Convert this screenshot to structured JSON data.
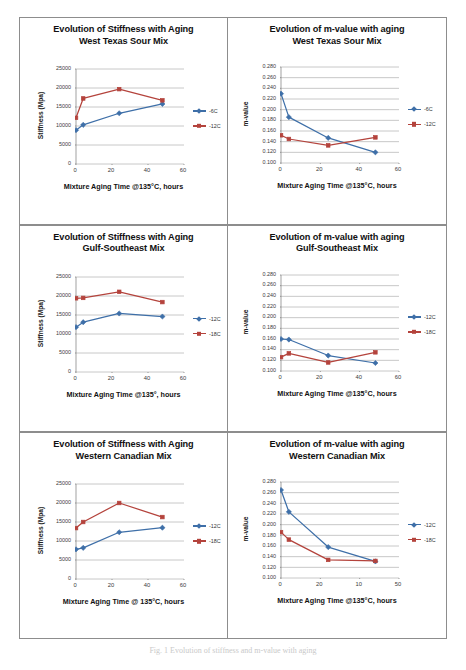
{
  "figure": {
    "caption": "Fig. 1 Evolution of stiffness and m-value with aging"
  },
  "colors": {
    "series_blue": "#3E6FA8",
    "series_red": "#B4433C",
    "grid": "#9a9a9a",
    "axis": "#7a7a7a",
    "panel_border": "#8d8d8d",
    "text": "#111111"
  },
  "panels": [
    {
      "id": "stiffness-west-texas",
      "title_line1": "Evolution of Stiffness with Aging",
      "title_line2": "West Texas Sour Mix",
      "chart_data": {
        "type": "line",
        "title": "Evolution of Stiffness with Aging West Texas Sour Mix",
        "xlabel": "Mixture Aging Time @135°C, hours",
        "ylabel": "Stiffness  (Mpa)",
        "xlim": [
          0,
          60
        ],
        "ylim": [
          0,
          25000
        ],
        "xticks": [
          0,
          20,
          40,
          60
        ],
        "yticks": [
          0,
          5000,
          10000,
          15000,
          20000,
          25000
        ],
        "grid": true,
        "legend_position": "right",
        "series": [
          {
            "name": "-6C",
            "color": "#3E6FA8",
            "marker": "diamond",
            "x": [
              0,
              4,
              24,
              48
            ],
            "y": [
              8900,
              10300,
              13350,
              15800
            ]
          },
          {
            "name": "-12C",
            "color": "#B4433C",
            "marker": "square",
            "x": [
              0,
              4,
              24,
              48
            ],
            "y": [
              12150,
              17250,
              19700,
              16750
            ]
          }
        ]
      }
    },
    {
      "id": "mvalue-west-texas",
      "title_line1": "Evolution of m-value with aging",
      "title_line2": "West Texas Sour Mix",
      "chart_data": {
        "type": "line",
        "title": "Evolution of m-value with aging West Texas Sour Mix",
        "xlabel": "Mixture Aging Time @135°C, hours",
        "ylabel": "m-value",
        "xlim": [
          0,
          60
        ],
        "ylim": [
          0.1,
          0.28
        ],
        "xticks": [
          0,
          20,
          40,
          60
        ],
        "yticks": [
          0.1,
          0.12,
          0.14,
          0.16,
          0.18,
          0.2,
          0.22,
          0.24,
          0.26,
          0.28
        ],
        "ytick_labels": [
          "0.100",
          "0.120",
          "0.140",
          "0.160",
          "0.180",
          "0.200",
          "0.220",
          "0.240",
          "0.260",
          "0.280"
        ],
        "grid": true,
        "legend_position": "right",
        "series": [
          {
            "name": "-6C",
            "color": "#3E6FA8",
            "marker": "diamond",
            "x": [
              0,
              4,
              24,
              48
            ],
            "y": [
              0.23,
              0.186,
              0.147,
              0.12
            ]
          },
          {
            "name": "-12C",
            "color": "#B4433C",
            "marker": "square",
            "x": [
              0,
              4,
              24,
              48
            ],
            "y": [
              0.152,
              0.145,
              0.133,
              0.148
            ]
          }
        ]
      }
    },
    {
      "id": "stiffness-gulf-southeast",
      "title_line1": "Evolution of Stiffness with Aging",
      "title_line2": "Gulf-Southeast Mix",
      "chart_data": {
        "type": "line",
        "title": "Evolution of Stiffness with Aging Gulf-Southeast Mix",
        "xlabel": "Mixture Aging Time @135°, hours",
        "ylabel": "Stiffness (Mpa)",
        "xlim": [
          0,
          60
        ],
        "ylim": [
          0,
          25000
        ],
        "xticks": [
          0,
          20,
          40,
          60
        ],
        "yticks": [
          0,
          5000,
          10000,
          15000,
          20000,
          25000
        ],
        "grid": true,
        "legend_position": "right",
        "series": [
          {
            "name": "-12C",
            "color": "#3E6FA8",
            "marker": "diamond",
            "x": [
              0,
              4,
              24,
              48
            ],
            "y": [
              11800,
              13100,
              15400,
              14600
            ]
          },
          {
            "name": "-18C",
            "color": "#B4433C",
            "marker": "square",
            "x": [
              0,
              4,
              24,
              48
            ],
            "y": [
              19400,
              19500,
              21100,
              18400
            ]
          }
        ]
      }
    },
    {
      "id": "mvalue-gulf-southeast",
      "title_line1": "Evolution of m-value with aging",
      "title_line2": "Gulf-Southeast Mix",
      "chart_data": {
        "type": "line",
        "title": "Evolution of m-value with aging Gulf-Southeast Mix",
        "xlabel": "Mixture Aging Time @135°C, hours",
        "ylabel": "m-value",
        "xlim": [
          0,
          60
        ],
        "ylim": [
          0.1,
          0.28
        ],
        "xticks": [
          0,
          20,
          40,
          60
        ],
        "yticks": [
          0.1,
          0.12,
          0.14,
          0.16,
          0.18,
          0.2,
          0.22,
          0.24,
          0.26,
          0.28
        ],
        "ytick_labels": [
          "0.100",
          "0.120",
          "0.140",
          "0.160",
          "0.180",
          "0.200",
          "0.220",
          "0.240",
          "0.260",
          "0.280"
        ],
        "grid": true,
        "legend_position": "right",
        "series": [
          {
            "name": "-12C",
            "color": "#3E6FA8",
            "marker": "diamond",
            "x": [
              0,
              4,
              24,
              48
            ],
            "y": [
              0.16,
              0.159,
              0.129,
              0.115
            ]
          },
          {
            "name": "-18C",
            "color": "#B4433C",
            "marker": "square",
            "x": [
              0,
              4,
              24,
              48
            ],
            "y": [
              0.126,
              0.133,
              0.116,
              0.135
            ]
          }
        ]
      }
    },
    {
      "id": "stiffness-western-canadian",
      "title_line1": "Evolution of Stiffness with Aging",
      "title_line2": "Western Canadian  Mix",
      "chart_data": {
        "type": "line",
        "title": "Evolution of Stiffness with Aging Western Canadian Mix",
        "xlabel": "Mixture Aging Time @ 135°C, hours",
        "ylabel": "Stiffness (Mpa)",
        "xlim": [
          0,
          60
        ],
        "ylim": [
          0,
          25000
        ],
        "xticks": [
          0,
          20,
          40,
          60
        ],
        "yticks": [
          0,
          5000,
          10000,
          15000,
          20000,
          25000
        ],
        "grid": true,
        "legend_position": "right",
        "series": [
          {
            "name": "-12C",
            "color": "#3E6FA8",
            "marker": "diamond",
            "x": [
              0,
              4,
              24,
              48
            ],
            "y": [
              7800,
              8200,
              12300,
              13500
            ]
          },
          {
            "name": "-18C",
            "color": "#B4433C",
            "marker": "square",
            "x": [
              0,
              4,
              24,
              48
            ],
            "y": [
              13400,
              15000,
              20000,
              16300
            ]
          }
        ]
      }
    },
    {
      "id": "mvalue-western-canadian",
      "title_line1": "Evolution of m-value with aging",
      "title_line2": "Western Canadian Mix",
      "chart_data": {
        "type": "line",
        "title": "Evolution of m-value with aging Western Canadian Mix",
        "xlabel": "Mixture Aging Time @135°C, hours",
        "ylabel": "m-value",
        "xlim": [
          0,
          60
        ],
        "ylim": [
          0.1,
          0.28
        ],
        "xticks": [
          0,
          20,
          40,
          60
        ],
        "xtick_labels": [
          "0",
          "20",
          "10",
          "50"
        ],
        "yticks": [
          0.1,
          0.12,
          0.14,
          0.16,
          0.18,
          0.2,
          0.22,
          0.24,
          0.26,
          0.28
        ],
        "ytick_labels": [
          "0.100",
          "0.120",
          "0.140",
          "0.160",
          "0.180",
          "0.200",
          "0.220",
          "0.240",
          "0.260",
          "0.280"
        ],
        "grid": true,
        "legend_position": "right",
        "series": [
          {
            "name": "-12C",
            "color": "#3E6FA8",
            "marker": "diamond",
            "x": [
              0,
              4,
              24,
              48
            ],
            "y": [
              0.265,
              0.224,
              0.158,
              0.131
            ]
          },
          {
            "name": "-18C",
            "color": "#B4433C",
            "marker": "square",
            "x": [
              0,
              4,
              24,
              48
            ],
            "y": [
              0.186,
              0.172,
              0.134,
              0.132
            ]
          }
        ]
      }
    }
  ]
}
